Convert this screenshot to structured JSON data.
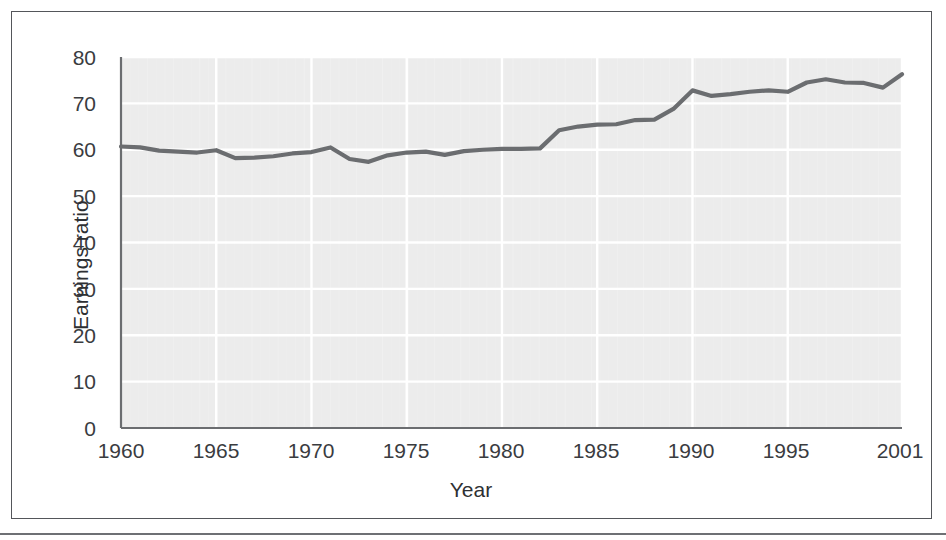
{
  "chart_data": {
    "type": "line",
    "title": "",
    "subtitle": "",
    "xlabel": "Year",
    "ylabel": "Earnings ratio",
    "xlim": [
      1960,
      2001
    ],
    "ylim": [
      0,
      80
    ],
    "grid": true,
    "legend": null,
    "legend_position": "none",
    "y_ticks": [
      0,
      10,
      20,
      30,
      40,
      50,
      60,
      70,
      80
    ],
    "y_tick_labels": [
      "0",
      "10",
      "20",
      "30",
      "40",
      "50",
      "60",
      "70",
      "80"
    ],
    "x_ticks": [
      1960,
      1965,
      1970,
      1975,
      1980,
      1985,
      1990,
      1995,
      2001
    ],
    "x_tick_labels": [
      "1960",
      "1965",
      "1970",
      "1975",
      "1980",
      "1985",
      "1990",
      "1995",
      "2001"
    ],
    "series": [
      {
        "name": "Earnings ratio",
        "color": "#6b6d70",
        "line_width": 4.2,
        "x": [
          1960,
          1961,
          1962,
          1963,
          1964,
          1965,
          1966,
          1967,
          1968,
          1969,
          1970,
          1971,
          1972,
          1973,
          1974,
          1975,
          1976,
          1977,
          1978,
          1979,
          1980,
          1981,
          1982,
          1983,
          1984,
          1985,
          1986,
          1987,
          1988,
          1989,
          1990,
          1991,
          1992,
          1993,
          1994,
          1995,
          1996,
          1997,
          1998,
          1999,
          2000,
          2001
        ],
        "values": [
          60.7,
          60.5,
          59.8,
          59.6,
          59.4,
          59.9,
          58.2,
          58.3,
          58.6,
          59.2,
          59.5,
          60.5,
          58.0,
          57.4,
          58.8,
          59.4,
          59.6,
          58.9,
          59.7,
          60.0,
          60.2,
          60.2,
          60.3,
          64.2,
          65.0,
          65.4,
          65.5,
          66.4,
          66.5,
          68.8,
          72.8,
          71.6,
          72.0,
          72.5,
          72.8,
          72.5,
          74.5,
          75.2,
          74.5,
          74.4,
          73.4,
          76.3
        ]
      }
    ]
  },
  "figure": {
    "plot_background_color": "#ececec",
    "gridline_color": "#ffffff",
    "axis_color": "#6b6d70",
    "frame_color": "#54565a",
    "text_color": "#2e3033"
  }
}
